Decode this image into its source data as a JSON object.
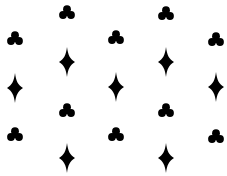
{
  "pattern": {
    "background": "#ffffff",
    "ink": "#000000",
    "shapes": [
      {
        "type": "club",
        "x": 67,
        "y": 12
      },
      {
        "type": "club",
        "x": 166,
        "y": 13
      },
      {
        "type": "club",
        "x": 15,
        "y": 38
      },
      {
        "type": "club",
        "x": 116,
        "y": 37
      },
      {
        "type": "club",
        "x": 216,
        "y": 39
      },
      {
        "type": "diamond",
        "x": 67,
        "y": 62
      },
      {
        "type": "diamond",
        "x": 166,
        "y": 62
      },
      {
        "type": "diamond",
        "x": 15,
        "y": 88
      },
      {
        "type": "diamond",
        "x": 116,
        "y": 87
      },
      {
        "type": "diamond",
        "x": 216,
        "y": 87
      },
      {
        "type": "club",
        "x": 67,
        "y": 110
      },
      {
        "type": "club",
        "x": 166,
        "y": 110
      },
      {
        "type": "club",
        "x": 15,
        "y": 134
      },
      {
        "type": "club",
        "x": 116,
        "y": 134
      },
      {
        "type": "club",
        "x": 216,
        "y": 136
      },
      {
        "type": "diamond",
        "x": 67,
        "y": 158
      },
      {
        "type": "diamond",
        "x": 166,
        "y": 158
      }
    ]
  }
}
